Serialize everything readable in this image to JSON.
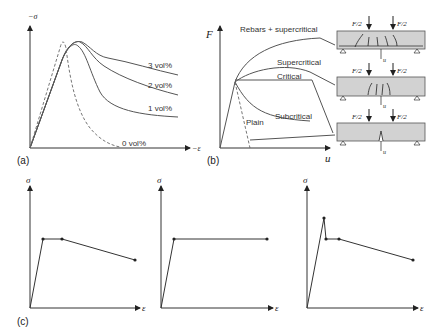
{
  "panel_a": {
    "label": "(a)",
    "y_axis": "−σ",
    "x_axis": "−ε",
    "curves": [
      {
        "name": "3 vol%",
        "style": "solid"
      },
      {
        "name": "2 vol%",
        "style": "solid"
      },
      {
        "name": "1 vol%",
        "style": "solid"
      },
      {
        "name": "0 vol%",
        "style": "dashed"
      }
    ]
  },
  "panel_b": {
    "label": "(b)",
    "y_axis": "F",
    "x_axis": "u",
    "curves": [
      {
        "name": "Rebars + supercritical"
      },
      {
        "name": "Supercritical"
      },
      {
        "name": "Critical"
      },
      {
        "name": "Subcritical"
      },
      {
        "name": "Plain"
      }
    ],
    "beams": [
      {
        "load_left": "F/2",
        "load_right": "F/2",
        "deflection": "u",
        "cracks": "multiple with rebar"
      },
      {
        "load_left": "F/2",
        "load_right": "F/2",
        "deflection": "u",
        "cracks": "multiple"
      },
      {
        "load_left": "F/2",
        "load_right": "F/2",
        "deflection": "u",
        "cracks": "single"
      }
    ]
  },
  "panel_c": {
    "label": "(c)",
    "plots": [
      {
        "y_axis": "σ",
        "x_axis": "ε",
        "description": "softening after plateau"
      },
      {
        "y_axis": "σ",
        "x_axis": "ε",
        "description": "elastic-perfectly plastic"
      },
      {
        "y_axis": "σ",
        "x_axis": "ε",
        "description": "peak drop, plateau, softening"
      }
    ]
  }
}
